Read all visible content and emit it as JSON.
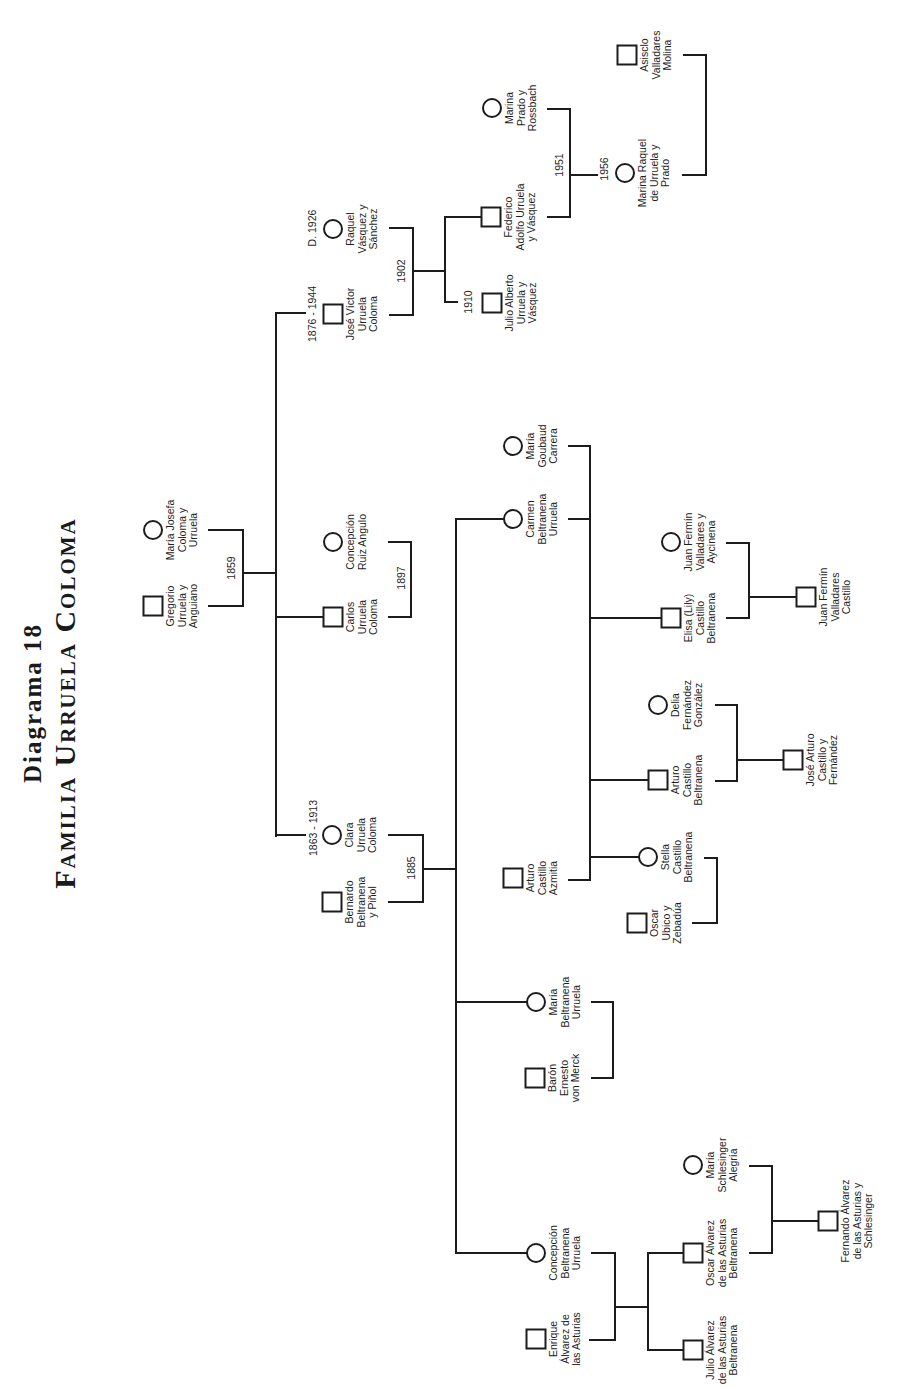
{
  "title": {
    "line1": "Diagrama 18",
    "line2": "Familia Urruela Coloma"
  },
  "people": [
    {
      "name": "Gregorio\nUrruela y\nAnguiano",
      "marker": "square"
    },
    {
      "name": "María Josefa\nColoma y\nUrruela",
      "marker": "circle"
    },
    {
      "name": "José Víctor\nUrruela\nColoma",
      "marker": "square",
      "date": "1876 - 1944"
    },
    {
      "name": "Raquel\nVásquez y\nSánchez",
      "marker": "circle",
      "date": "D. 1926"
    },
    {
      "name": "Carlos\nUrruela\nColoma",
      "marker": "square"
    },
    {
      "name": "Concepción\nRuiz Angulo",
      "marker": "circle"
    },
    {
      "name": "Clara\nUrruela\nColoma",
      "marker": "circle",
      "date": "1863 - 1913"
    },
    {
      "name": "Bernardo\nBeltranena\ny Piñol",
      "marker": "square"
    },
    {
      "name": "Federico\nAdolfo Urruela\ny Vásquez",
      "marker": "square"
    },
    {
      "name": "Julio Alberto\nUrruela y\nVásquez",
      "marker": "square",
      "date": "1910"
    },
    {
      "name": "Marina\nPrado y\nRossbach",
      "marker": "circle"
    },
    {
      "name": "Marina Raquel\nde Urruela y\nPrado",
      "marker": "circle",
      "date": "1956"
    },
    {
      "name": "Asisclo\nValladares\nMolina",
      "marker": "square"
    },
    {
      "name": "María\nGoubaud\nCarrera",
      "marker": "circle"
    },
    {
      "name": "Carmen\nBeltranena\nUrruela",
      "marker": "circle"
    },
    {
      "name": "Arturo\nCastillo\nAzmitia",
      "marker": "square"
    },
    {
      "name": "Juan Fermín\nValladares y\nAycinena",
      "marker": "circle"
    },
    {
      "name": "Elisa (Lily)\nCastillo\nBeltranena",
      "marker": "square"
    },
    {
      "name": "Juan Fermín\nValladares\nCastillo",
      "marker": "square"
    },
    {
      "name": "Delia\nFernández\nGonzález",
      "marker": "circle"
    },
    {
      "name": "Arturo\nCastillo\nBeltranena",
      "marker": "square"
    },
    {
      "name": "José Arturo\nCastillo y\nFernández",
      "marker": "square"
    },
    {
      "name": "Stella\nCastillo\nBeltranena",
      "marker": "circle"
    },
    {
      "name": "Oscar\nUbico y\nZebadúa",
      "marker": "square"
    },
    {
      "name": "María\nBeltranena\nUrruela",
      "marker": "circle"
    },
    {
      "name": "Barón\nErnesto\nvon Merck",
      "marker": "square"
    },
    {
      "name": "Concepción\nBeltranena\nUrruela",
      "marker": "circle"
    },
    {
      "name": "Enrique\nÁlvarez de\nlas Asturias",
      "marker": "square"
    },
    {
      "name": "María\nSchlesinger\nAlegría",
      "marker": "circle"
    },
    {
      "name": "Oscar Álvarez\nde las Asturias\nBeltranena",
      "marker": "square"
    },
    {
      "name": "Julio Álvarez\nde las Asturias\nBeltranena",
      "marker": "square"
    },
    {
      "name": "Fernando Álvarez\nde las Asturias y\nSchlesinger",
      "marker": "square"
    }
  ],
  "marriages": [
    {
      "year": "1859"
    },
    {
      "year": "1902"
    },
    {
      "year": "1897"
    },
    {
      "year": "1885"
    },
    {
      "year": "1951"
    }
  ]
}
